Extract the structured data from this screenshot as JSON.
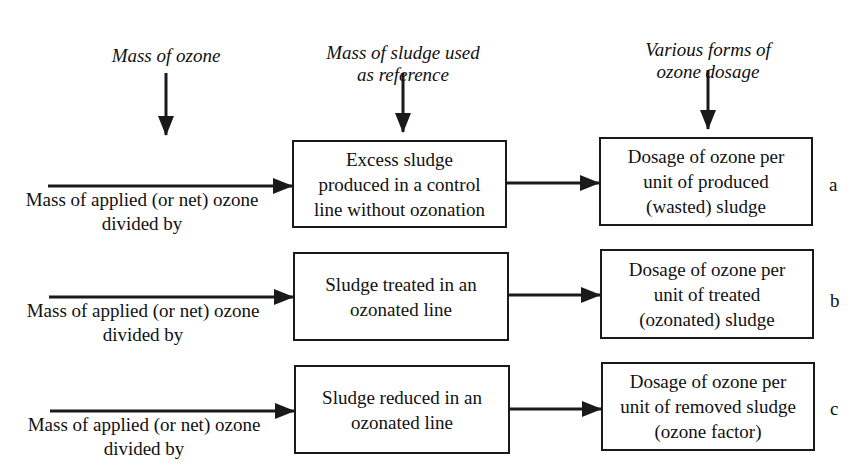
{
  "diagram": {
    "type": "flow",
    "column_headers": [
      {
        "label": "Mass of ozone"
      },
      {
        "label": "Mass of sludge used\nas reference"
      },
      {
        "label": "Various forms of\nozone dosage"
      }
    ],
    "rows": [
      {
        "id": "a",
        "source": "Mass of applied (or net) ozone\ndivided by",
        "reference": "Excess sludge\nproduced in a control\nline without ozonation",
        "dosage": "Dosage of ozone per\nunit of produced\n(wasted) sludge",
        "label": "a"
      },
      {
        "id": "b",
        "source": "Mass of applied (or net) ozone\ndivided by",
        "reference": "Sludge treated in an\nozonated line",
        "dosage": "Dosage of ozone per\nunit of treated\n(ozonated) sludge",
        "label": "b"
      },
      {
        "id": "c",
        "source": "Mass of applied (or net) ozone\ndivided by",
        "reference": "Sludge reduced in an\nozonated line",
        "dosage": "Dosage of ozone per\nunit of removed sludge\n(ozone factor)",
        "label": "c"
      }
    ],
    "edges": [
      {
        "from": "header-0",
        "to": "source-column"
      },
      {
        "from": "header-1",
        "to": "reference-a"
      },
      {
        "from": "header-2",
        "to": "dosage-a"
      },
      {
        "from": "source-a",
        "to": "reference-a"
      },
      {
        "from": "reference-a",
        "to": "dosage-a"
      },
      {
        "from": "source-b",
        "to": "reference-b"
      },
      {
        "from": "reference-b",
        "to": "dosage-b"
      },
      {
        "from": "source-c",
        "to": "reference-c"
      },
      {
        "from": "reference-c",
        "to": "dosage-c"
      }
    ],
    "colors": {
      "line": "#1a1a1a",
      "background": "#ffffff",
      "text": "#111111"
    }
  }
}
